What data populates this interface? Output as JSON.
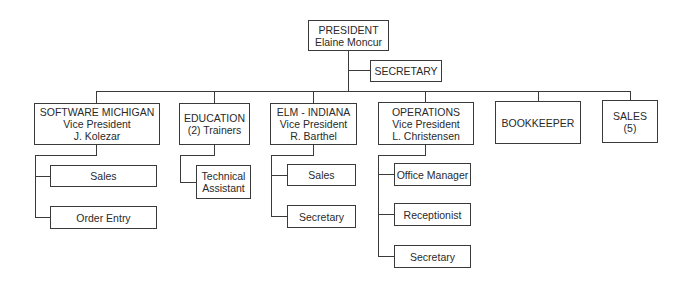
{
  "chart": {
    "root": {
      "title": "PRESIDENT",
      "name": "Elaine Moncur"
    },
    "staff": {
      "title": "SECRETARY"
    },
    "departments": [
      {
        "title": "SOFTWARE MICHIGAN",
        "role": "Vice President",
        "name": "J. Kolezar",
        "children": [
          "Sales",
          "Order Entry"
        ]
      },
      {
        "title": "EDUCATION",
        "role": "(2) Trainers",
        "children": [
          "Technical",
          "Assistant"
        ]
      },
      {
        "title": "ELM - INDIANA",
        "role": "Vice President",
        "name": "R. Barthel",
        "children": [
          "Sales",
          "Secretary"
        ]
      },
      {
        "title": "OPERATIONS",
        "role": "Vice President",
        "name": "L. Christensen",
        "children": [
          "Office Manager",
          "Receptionist",
          "Secretary"
        ]
      },
      {
        "title": "BOOKKEEPER"
      },
      {
        "title": "SALES",
        "role": "(5)"
      }
    ]
  }
}
